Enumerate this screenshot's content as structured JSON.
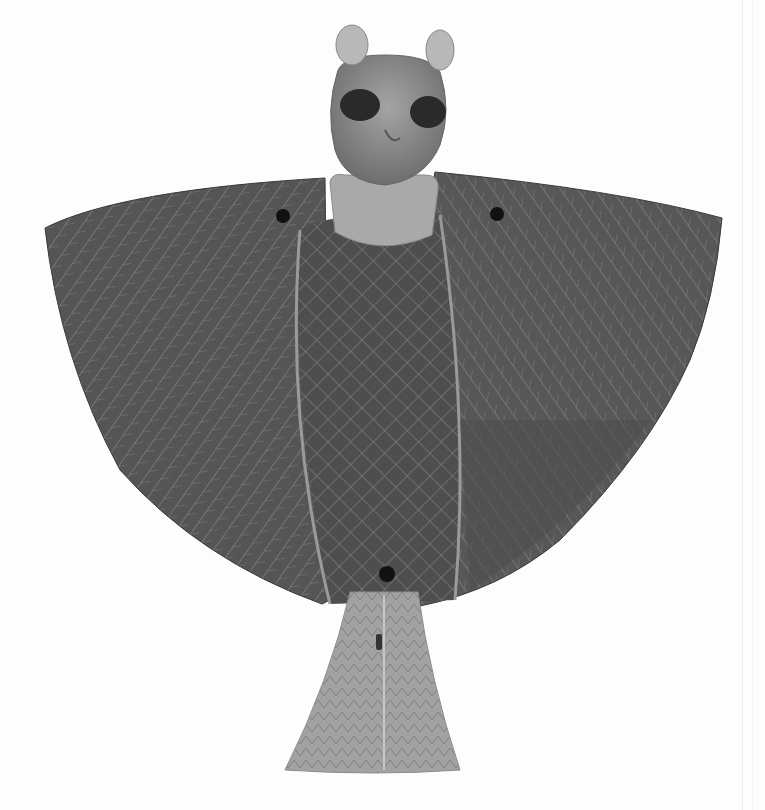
{
  "image": {
    "subject": "Bronze winged figure with feline head (bat/owl-like amulet)",
    "colors": {
      "background": "#fdfdfd",
      "wing_dark": "#4a4a4a",
      "wing_mid": "#6a6a6a",
      "head": "#8c8c8c",
      "collar": "#a8a8a8",
      "tail": "#a0a0a0",
      "incision": "#9a9a9a",
      "hole": "#111111",
      "eye": "#2a2a2a"
    }
  }
}
